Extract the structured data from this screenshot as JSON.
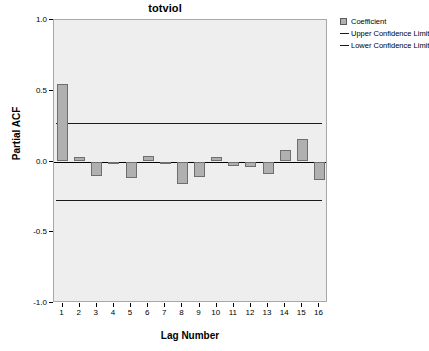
{
  "chart_data": {
    "type": "bar",
    "title": "totviol",
    "xlabel": "Lag Number",
    "ylabel": "Partial ACF",
    "categories": [
      1,
      2,
      3,
      4,
      5,
      6,
      7,
      8,
      9,
      10,
      11,
      12,
      13,
      14,
      15,
      16
    ],
    "values": [
      0.55,
      0.03,
      -0.1,
      -0.01,
      -0.12,
      0.04,
      -0.02,
      -0.16,
      -0.11,
      0.03,
      -0.03,
      -0.04,
      -0.09,
      0.08,
      0.16,
      -0.13
    ],
    "series": [
      {
        "name": "Coefficient",
        "values": [
          0.55,
          0.03,
          -0.1,
          -0.01,
          -0.12,
          0.04,
          -0.02,
          -0.16,
          -0.11,
          0.03,
          -0.03,
          -0.04,
          -0.09,
          0.08,
          0.16,
          -0.13
        ]
      }
    ],
    "upper_confidence_limit": 0.27,
    "lower_confidence_limit": -0.27,
    "ylim": [
      -1.0,
      1.0
    ],
    "yticks": [
      "1.0",
      "0.5",
      "0.0",
      "-0.5",
      "-1.0"
    ],
    "ytick_values": [
      1.0,
      0.5,
      0.0,
      -0.5,
      -1.0
    ],
    "xticks": [
      "1",
      "2",
      "3",
      "4",
      "5",
      "6",
      "7",
      "8",
      "9",
      "10",
      "11",
      "12",
      "13",
      "14",
      "15",
      "16"
    ],
    "grid": false,
    "legend_position": "right",
    "colors": {
      "bar_fill": "#b0b0b0",
      "bar_edge": "#6e6e6e",
      "plot_background": "#eeeeee",
      "axis": "#000000",
      "confidence_line": "#1a1a1a"
    }
  },
  "legend": {
    "items": [
      {
        "label": "Coefficient",
        "type": "box"
      },
      {
        "label": "Upper Confidence Limit",
        "type": "line"
      },
      {
        "label": "Lower Confidence Limit",
        "type": "line"
      }
    ]
  }
}
